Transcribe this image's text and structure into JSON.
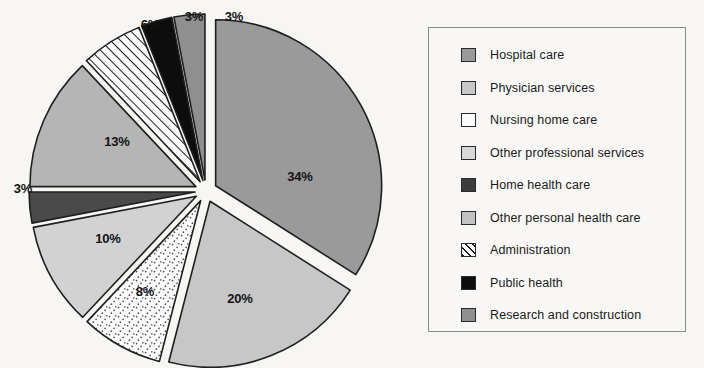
{
  "chart_data": {
    "type": "pie",
    "title": "",
    "subtitle": "",
    "xlabel": "",
    "ylabel": "",
    "grid": false,
    "legend_position": "right",
    "total_percent": 100,
    "start_angle_deg": 0,
    "direction": "clockwise",
    "exploded": true,
    "categories": [
      "Hospital care",
      "Physician services",
      "Nursing home care",
      "Other professional services",
      "Home health care",
      "Other personal health care",
      "Administration",
      "Public health",
      "Research and construction"
    ],
    "values": [
      34,
      20,
      8,
      10,
      3,
      13,
      6,
      3,
      3
    ],
    "value_labels": [
      "34%",
      "20%",
      "8%",
      "10%",
      "3%",
      "13%",
      "6%",
      "3%",
      "3%"
    ],
    "slices": [
      {
        "label": "Hospital care",
        "value": 34,
        "value_label": "34%",
        "color": "#9a9a9a",
        "pattern": "solid",
        "label_x": 300,
        "label_y": 176
      },
      {
        "label": "Physician services",
        "value": 20,
        "value_label": "20%",
        "color": "#c7c7c7",
        "pattern": "solid",
        "label_x": 240,
        "label_y": 298
      },
      {
        "label": "Nursing home care",
        "value": 8,
        "value_label": "8%",
        "color": "#fbfbfb",
        "pattern": "speckle",
        "label_x": 145,
        "label_y": 291
      },
      {
        "label": "Other professional services",
        "value": 10,
        "value_label": "10%",
        "color": "#d2d2d2",
        "pattern": "solid",
        "label_x": 108,
        "label_y": 238
      },
      {
        "label": "Home health care",
        "value": 3,
        "value_label": "3%",
        "color": "#4a4a4a",
        "pattern": "solid",
        "label_x": 23,
        "label_y": 188
      },
      {
        "label": "Other personal health care",
        "value": 13,
        "value_label": "13%",
        "color": "#b5b5b5",
        "pattern": "solid",
        "label_x": 117,
        "label_y": 141
      },
      {
        "label": "Administration",
        "value": 6,
        "value_label": "6%",
        "color": "#fbfbfb",
        "pattern": "hatch",
        "label_x": 150,
        "label_y": 24
      },
      {
        "label": "Public health",
        "value": 3,
        "value_label": "3%",
        "color": "#0d0d0d",
        "pattern": "solid",
        "label_x": 194,
        "label_y": 16
      },
      {
        "label": "Research and construction",
        "value": 3,
        "value_label": "3%",
        "color": "#8f8f8f",
        "pattern": "solid",
        "label_x": 234,
        "label_y": 16
      }
    ],
    "geometry": {
      "center_x": 206,
      "center_y": 191,
      "radius": 166,
      "explode_offset": 11
    }
  },
  "legend": {
    "items": [
      {
        "label": "Hospital care",
        "color": "#9a9a9a",
        "pattern": "solid"
      },
      {
        "label": "Physician services",
        "color": "#c7c7c7",
        "pattern": "solid"
      },
      {
        "label": "Nursing home care",
        "color": "#fbfbfb",
        "pattern": "speckle"
      },
      {
        "label": "Other professional services",
        "color": "#d8d8d8",
        "pattern": "solid"
      },
      {
        "label": "Home health care",
        "color": "#3d3d3d",
        "pattern": "solid"
      },
      {
        "label": "Other personal health care",
        "color": "#c2c2c2",
        "pattern": "solid"
      },
      {
        "label": "Administration",
        "color": "#fbfbfb",
        "pattern": "hatch"
      },
      {
        "label": "Public health",
        "color": "#0d0d0d",
        "pattern": "solid"
      },
      {
        "label": "Research and construction",
        "color": "#8f8f8f",
        "pattern": "solid"
      }
    ]
  },
  "style": {
    "background": "#f7f6f3",
    "outline": "#1f1f1f",
    "legend_border": "#8a8a8a",
    "text": "#1b1b1b"
  }
}
